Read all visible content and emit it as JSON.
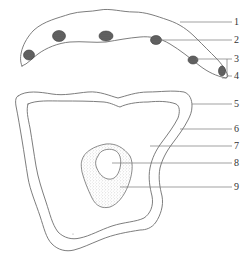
{
  "figure": {
    "type": "labeled-cell-diagram",
    "parts": {
      "upper": "elongated cell with a row of small dark granules along its lower edge",
      "lower": "large polygonal cell with thick wall, cytoplasm, and central nucleus containing a nucleolus-like clear region"
    },
    "labels": [
      {
        "id": "1",
        "text": "1"
      },
      {
        "id": "2",
        "text": "2"
      },
      {
        "id": "3",
        "text": "3"
      },
      {
        "id": "4",
        "text": "4"
      },
      {
        "id": "5",
        "text": "5"
      },
      {
        "id": "6",
        "text": "6"
      },
      {
        "id": "7",
        "text": "7"
      },
      {
        "id": "8",
        "text": "8"
      },
      {
        "id": "9",
        "text": "9"
      }
    ],
    "colors": {
      "line": "#6e6e6e",
      "granule": "#4a4a4a",
      "stipple": "#9a9a9a",
      "label": "#333333",
      "background": "#ffffff"
    }
  }
}
